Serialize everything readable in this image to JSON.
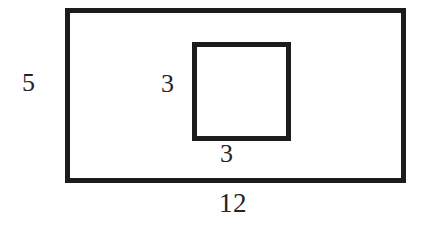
{
  "figure": {
    "background_color": "#ffffff",
    "stroke_color": "#1c1c1c",
    "text_color": "#242424",
    "shapes": [
      {
        "name": "outer-rectangle",
        "type": "rectangle",
        "width_value": "12",
        "height_value": "5",
        "stroke_width_px": 5
      },
      {
        "name": "inner-square",
        "type": "square",
        "width_value": "3",
        "height_value": "3",
        "stroke_width_px": 5
      }
    ],
    "labels": {
      "outer_height": "5",
      "outer_width": "12",
      "inner_height": "3",
      "inner_width": "3"
    }
  }
}
